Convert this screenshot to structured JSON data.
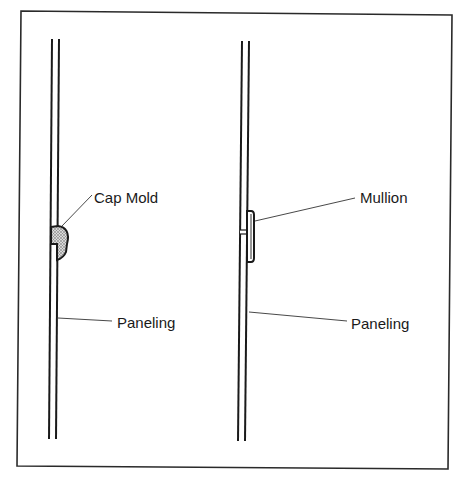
{
  "diagram": {
    "left": {
      "labels": {
        "cap_mold": "Cap Mold",
        "paneling": "Paneling"
      }
    },
    "right": {
      "labels": {
        "mullion": "Mullion",
        "paneling": "Paneling"
      }
    },
    "colors": {
      "line": "#1a1a1a",
      "fill": "#bdbdbd",
      "background": "#ffffff"
    }
  }
}
